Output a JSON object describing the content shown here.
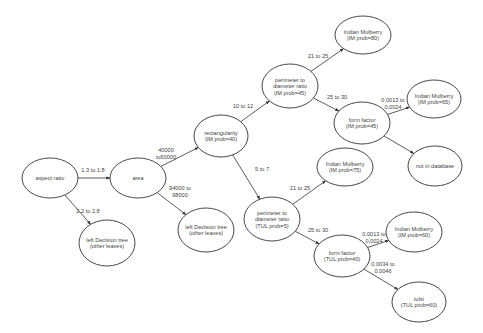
{
  "diagram": {
    "type": "decision-tree",
    "nodes": [
      {
        "id": "aspect_ratio",
        "lines": [
          "aspect ratio"
        ],
        "cx": 50,
        "cy": 178,
        "rx": 28,
        "ry": 20
      },
      {
        "id": "area",
        "lines": [
          "area"
        ],
        "cx": 138,
        "cy": 178,
        "rx": 28,
        "ry": 20
      },
      {
        "id": "left_dt_1",
        "lines": [
          "left Decision tree",
          "(other leaves)"
        ],
        "cx": 107,
        "cy": 243,
        "rx": 28,
        "ry": 23
      },
      {
        "id": "left_dt_2",
        "lines": [
          "left Decision tree",
          "(other leaves)"
        ],
        "cx": 206,
        "cy": 230,
        "rx": 28,
        "ry": 22
      },
      {
        "id": "rectangularity",
        "lines": [
          "rectangularity",
          "(IM prob=40)"
        ],
        "cx": 221,
        "cy": 136,
        "rx": 27,
        "ry": 21
      },
      {
        "id": "perimeter_im",
        "lines": [
          "perimeter to",
          "diameter ratio",
          "(IM prob=45)"
        ],
        "cx": 290,
        "cy": 86,
        "rx": 28,
        "ry": 22
      },
      {
        "id": "mulberry_80",
        "lines": [
          "Indian Mulberry",
          "(IM prob=80)"
        ],
        "cx": 363,
        "cy": 35,
        "rx": 28,
        "ry": 19
      },
      {
        "id": "form_factor_im",
        "lines": [
          "form factor",
          "(IM prob=45)"
        ],
        "cx": 362,
        "cy": 123,
        "rx": 28,
        "ry": 21
      },
      {
        "id": "mulberry_65",
        "lines": [
          "Indian Mulberry",
          "(IM prob=65)"
        ],
        "cx": 434,
        "cy": 99,
        "rx": 27,
        "ry": 19
      },
      {
        "id": "not_in_db",
        "lines": [
          "not in database"
        ],
        "cx": 435,
        "cy": 166,
        "rx": 27,
        "ry": 20
      },
      {
        "id": "mulberry_75",
        "lines": [
          "Indian Mulberry",
          "(IM prob=75)"
        ],
        "cx": 345,
        "cy": 167,
        "rx": 28,
        "ry": 19
      },
      {
        "id": "perimeter_tul",
        "lines": [
          "perimeter to",
          "diameter ratio",
          "(TUL prob=5)"
        ],
        "cx": 272,
        "cy": 219,
        "rx": 28,
        "ry": 22
      },
      {
        "id": "form_factor_tul",
        "lines": [
          "form factor",
          "(TUL prob=40)"
        ],
        "cx": 342,
        "cy": 256,
        "rx": 28,
        "ry": 21
      },
      {
        "id": "mulberry_60",
        "lines": [
          "Indian Mulberry",
          "(IM prob=60)"
        ],
        "cx": 414,
        "cy": 232,
        "rx": 28,
        "ry": 20
      },
      {
        "id": "tulsi",
        "lines": [
          "tulsi",
          "(TUL prob=60)"
        ],
        "cx": 419,
        "cy": 302,
        "rx": 27,
        "ry": 20
      }
    ],
    "edges": [
      {
        "from": "aspect_ratio",
        "to": "area",
        "label": [
          "1.3 to 1.8"
        ],
        "lx": 93,
        "ly": 172
      },
      {
        "from": "aspect_ratio",
        "to": "left_dt_1",
        "label": [
          "2.2 to 2.8"
        ],
        "lx": 88,
        "ly": 213
      },
      {
        "from": "area",
        "to": "rectangularity",
        "label": [
          "40000",
          "to50000"
        ],
        "lx": 166,
        "ly": 152
      },
      {
        "from": "area",
        "to": "left_dt_2",
        "label": [
          "94000 to",
          "98000"
        ],
        "lx": 180,
        "ly": 190
      },
      {
        "from": "rectangularity",
        "to": "perimeter_im",
        "label": [
          "10 to 12"
        ],
        "lx": 243,
        "ly": 108
      },
      {
        "from": "rectangularity",
        "to": "perimeter_tul",
        "label": [
          "5 to 7"
        ],
        "lx": 262,
        "ly": 171
      },
      {
        "from": "perimeter_im",
        "to": "mulberry_80",
        "label": [
          "21 to 25"
        ],
        "lx": 318,
        "ly": 58
      },
      {
        "from": "perimeter_im",
        "to": "form_factor_im",
        "label": [
          "25 to 30"
        ],
        "lx": 337,
        "ly": 99
      },
      {
        "from": "form_factor_im",
        "to": "mulberry_65",
        "label": [
          "0.0013 to",
          "0.0024"
        ],
        "lx": 393,
        "ly": 102
      },
      {
        "from": "form_factor_im",
        "to": "not_in_db",
        "label": [],
        "lx": 0,
        "ly": 0
      },
      {
        "from": "perimeter_tul",
        "to": "mulberry_75",
        "label": [
          "21 to 25"
        ],
        "lx": 300,
        "ly": 190
      },
      {
        "from": "perimeter_tul",
        "to": "form_factor_tul",
        "label": [
          "25 to 30"
        ],
        "lx": 318,
        "ly": 232
      },
      {
        "from": "form_factor_tul",
        "to": "mulberry_60",
        "label": [
          "0.0013 to",
          "0.0024"
        ],
        "lx": 374,
        "ly": 236
      },
      {
        "from": "form_factor_tul",
        "to": "tulsi",
        "label": [
          "0.0034 to",
          "0.0046"
        ],
        "lx": 383,
        "ly": 266
      }
    ]
  }
}
